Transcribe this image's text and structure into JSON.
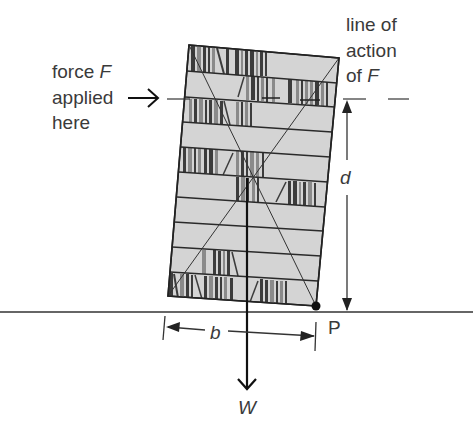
{
  "figure": {
    "labels": {
      "force_line1": "force ",
      "force_symbol": "F",
      "force_line2": "applied",
      "force_line3": "here",
      "action_line1": "line of",
      "action_line2": "action",
      "action_line3": "of ",
      "action_symbol": "F",
      "distance_d": "d",
      "distance_b": "b",
      "pivot": "P",
      "weight": "W"
    },
    "colors": {
      "background": "#ffffff",
      "bookcase_fill": "#d4d4d4",
      "outline": "#222222",
      "book_dark": "#3c3c3c",
      "book_mid": "#8a8a8a",
      "text": "#3a3a3a"
    },
    "bookcase": {
      "corners": {
        "top_left": [
          189,
          45
        ],
        "top_right": [
          339,
          58
        ],
        "bottom_right": [
          316,
          306
        ],
        "bottom_left": [
          168,
          296
        ]
      },
      "shelf_count": 10,
      "filled_shelves": [
        0,
        2,
        4,
        5,
        8,
        9
      ]
    },
    "ground_y": 312
  }
}
